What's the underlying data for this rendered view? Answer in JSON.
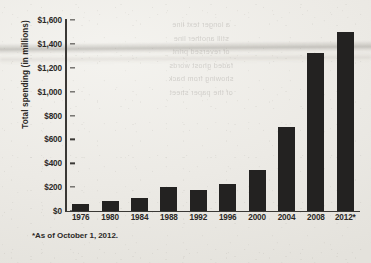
{
  "chart_data": {
    "type": "bar",
    "title": "",
    "subtitle": "",
    "xlabel": "",
    "ylabel": "Total spending (in millions)",
    "categories": [
      "1976",
      "1980",
      "1984",
      "1988",
      "1992",
      "1996",
      "2000",
      "2004",
      "2008",
      "2012*"
    ],
    "values": [
      60,
      85,
      105,
      200,
      180,
      225,
      345,
      700,
      1320,
      1500
    ],
    "ylim": [
      0,
      1600
    ],
    "ytick_values": [
      0,
      200,
      400,
      600,
      800,
      1000,
      1200,
      1400,
      1600
    ],
    "ytick_labels": [
      "$0",
      "$200",
      "$400",
      "$600",
      "$800",
      "$1,000",
      "$1,200",
      "$1,400",
      "$1,600"
    ],
    "grid": false,
    "legend": false,
    "legend_position": "none",
    "bar_color": "#232221",
    "axis_color": "#3a3835",
    "background_color": "#efeeea"
  },
  "footnote": "*As of October 1, 2012.",
  "showthrough_text": "a longer text line\nstill another line\nof reversed print\nfaded ghost words\nshowing from back\nof the paper sheet"
}
